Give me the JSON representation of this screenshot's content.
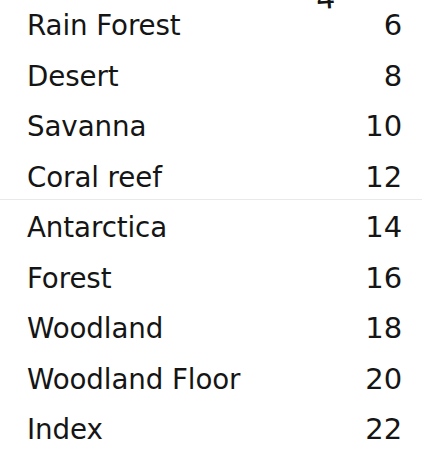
{
  "document": {
    "type": "table-of-contents",
    "background_color": "#ffffff",
    "text_color": "#151515"
  },
  "artifacts": {
    "clipped_top_glyph": "4",
    "scan_line_note": ""
  },
  "toc": {
    "entries": [
      {
        "title": "Rain Forest",
        "page": "6"
      },
      {
        "title": "Desert",
        "page": "8"
      },
      {
        "title": "Savanna",
        "page": "10"
      },
      {
        "title": "Coral reef",
        "page": "12"
      },
      {
        "title": "Antarctica",
        "page": "14"
      },
      {
        "title": "Forest",
        "page": "16"
      },
      {
        "title": "Woodland",
        "page": "18"
      },
      {
        "title": "Woodland Floor",
        "page": "20"
      },
      {
        "title": "Index",
        "page": "22"
      }
    ]
  }
}
